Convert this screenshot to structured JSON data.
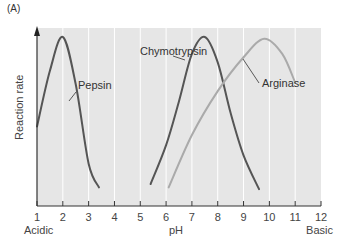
{
  "panel_label": "(A)",
  "chart_data": {
    "type": "line",
    "title": "",
    "xlabel": "pH",
    "ylabel": "Reaction rate",
    "xlim": [
      1,
      12
    ],
    "x_ticks": [
      1,
      2,
      3,
      4,
      5,
      6,
      7,
      8,
      9,
      10,
      11,
      12
    ],
    "x_end_labels": {
      "left": "Acidic",
      "right": "Basic"
    },
    "grid": "vertical",
    "y_ticks": [],
    "series": [
      {
        "name": "Pepsin",
        "color": "#555555",
        "x": [
          1.0,
          1.5,
          2.0,
          2.5,
          3.0,
          3.4
        ],
        "y": [
          0.47,
          0.8,
          1.0,
          0.72,
          0.25,
          0.11
        ],
        "peak_pH": 2.0
      },
      {
        "name": "Chymotrypsin",
        "color": "#555555",
        "x": [
          5.4,
          6.0,
          6.5,
          7.0,
          7.5,
          8.0,
          8.5,
          9.0,
          9.6
        ],
        "y": [
          0.13,
          0.36,
          0.62,
          0.9,
          1.0,
          0.85,
          0.55,
          0.3,
          0.1
        ],
        "peak_pH": 7.5
      },
      {
        "name": "Arginase",
        "color": "#aaaaaa",
        "x": [
          6.1,
          7.0,
          8.0,
          9.0,
          9.8,
          10.5,
          11.0
        ],
        "y": [
          0.11,
          0.42,
          0.68,
          0.88,
          0.99,
          0.9,
          0.73
        ],
        "peak_pH": 9.8
      }
    ]
  }
}
